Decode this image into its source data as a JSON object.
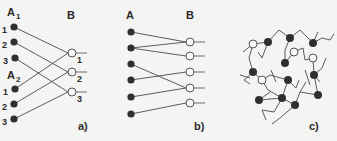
{
  "panels": [
    {
      "id": "a",
      "caption": "a)",
      "group_labels": {
        "a1": "A",
        "a1_sub": "1",
        "a2": "A",
        "a2_sub": "2",
        "b": "B"
      },
      "a_nodes": [
        {
          "label": "1",
          "x": 14,
          "y": 27
        },
        {
          "label": "2",
          "x": 14,
          "y": 42
        },
        {
          "label": "3",
          "x": 15,
          "y": 58
        },
        {
          "label": "1",
          "x": 15,
          "y": 89
        },
        {
          "label": "2",
          "x": 14,
          "y": 104
        },
        {
          "label": "3",
          "x": 14,
          "y": 119
        }
      ],
      "b_nodes": [
        {
          "label": "1",
          "x": 72,
          "y": 53
        },
        {
          "label": "2",
          "x": 72,
          "y": 72
        },
        {
          "label": "3",
          "x": 72,
          "y": 92
        }
      ],
      "edges": [
        [
          0,
          0
        ],
        [
          1,
          1
        ],
        [
          2,
          2
        ],
        [
          3,
          0
        ],
        [
          4,
          1
        ],
        [
          5,
          2
        ]
      ]
    },
    {
      "id": "b",
      "caption": "b)",
      "group_labels": {
        "a": "A",
        "b": "B"
      },
      "a_nodes": [
        {
          "x": 131,
          "y": 32
        },
        {
          "x": 131,
          "y": 48
        },
        {
          "x": 131,
          "y": 64
        },
        {
          "x": 131,
          "y": 80
        },
        {
          "x": 131,
          "y": 97
        },
        {
          "x": 131,
          "y": 114
        }
      ],
      "b_nodes": [
        {
          "x": 190,
          "y": 42
        },
        {
          "x": 190,
          "y": 56
        },
        {
          "x": 190,
          "y": 72
        },
        {
          "x": 190,
          "y": 88
        },
        {
          "x": 190,
          "y": 103
        }
      ],
      "edges": [
        [
          0,
          0
        ],
        [
          1,
          0
        ],
        [
          1,
          1
        ],
        [
          2,
          3
        ],
        [
          3,
          2
        ],
        [
          4,
          3
        ],
        [
          5,
          4
        ]
      ]
    },
    {
      "id": "c",
      "caption": "c)",
      "filled_nodes": [
        [
          268,
          42
        ],
        [
          290,
          38
        ],
        [
          313,
          43
        ],
        [
          285,
          63
        ],
        [
          253,
          72
        ],
        [
          288,
          80
        ],
        [
          314,
          75
        ],
        [
          259,
          100
        ],
        [
          282,
          98
        ],
        [
          318,
          95
        ],
        [
          295,
          105
        ]
      ],
      "open_nodes": [
        [
          253,
          44
        ],
        [
          294,
          52
        ],
        [
          313,
          58
        ],
        [
          262,
          80
        ]
      ],
      "bonds": [
        [
          253,
          44,
          268,
          42
        ],
        [
          268,
          42,
          279,
          30
        ],
        [
          279,
          30,
          290,
          38
        ],
        [
          290,
          38,
          300,
          30
        ],
        [
          300,
          30,
          313,
          43
        ],
        [
          313,
          43,
          322,
          38
        ],
        [
          322,
          38,
          330,
          40
        ],
        [
          253,
          44,
          249,
          58
        ],
        [
          249,
          58,
          253,
          72
        ],
        [
          268,
          42,
          262,
          58
        ],
        [
          262,
          58,
          258,
          52
        ],
        [
          290,
          38,
          285,
          50
        ],
        [
          285,
          50,
          285,
          63
        ],
        [
          285,
          63,
          294,
          52
        ],
        [
          294,
          52,
          303,
          48
        ],
        [
          303,
          48,
          305,
          60
        ],
        [
          305,
          60,
          313,
          58
        ],
        [
          313,
          58,
          314,
          75
        ],
        [
          314,
          75,
          322,
          68
        ],
        [
          322,
          68,
          326,
          58
        ],
        [
          253,
          72,
          262,
          80
        ],
        [
          262,
          80,
          270,
          75
        ],
        [
          262,
          80,
          268,
          90
        ],
        [
          268,
          90,
          282,
          98
        ],
        [
          282,
          98,
          288,
          80
        ],
        [
          288,
          80,
          270,
          75
        ],
        [
          288,
          80,
          296,
          88
        ],
        [
          253,
          72,
          244,
          80
        ],
        [
          244,
          80,
          250,
          84
        ],
        [
          259,
          100,
          270,
          92
        ],
        [
          259,
          100,
          282,
          98
        ],
        [
          282,
          98,
          295,
          105
        ],
        [
          295,
          105,
          300,
          92
        ],
        [
          300,
          92,
          318,
          95
        ],
        [
          318,
          95,
          314,
          75
        ],
        [
          282,
          98,
          274,
          112
        ],
        [
          274,
          112,
          262,
          110
        ],
        [
          295,
          105,
          280,
          118
        ],
        [
          280,
          118,
          272,
          124
        ],
        [
          253,
          44,
          243,
          52
        ],
        [
          313,
          43,
          318,
          32
        ],
        [
          276,
          82,
          271,
          70
        ],
        [
          296,
          88,
          299,
          80
        ],
        [
          305,
          70,
          310,
          85
        ],
        [
          240,
          75,
          250,
          78
        ],
        [
          330,
          40,
          334,
          34
        ],
        [
          314,
          75,
          320,
          82
        ],
        [
          300,
          92,
          306,
          82
        ],
        [
          262,
          110,
          266,
          120
        ]
      ]
    }
  ]
}
